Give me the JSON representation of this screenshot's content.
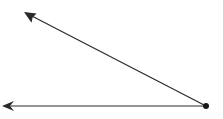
{
  "diagram": {
    "type": "angle",
    "colors": {
      "stroke": "#2a2a2a",
      "background": "#ffffff"
    },
    "vertex": {
      "x": 206,
      "y": 106
    },
    "rays": [
      {
        "name": "upper-ray",
        "to": {
          "x": 24,
          "y": 12
        }
      },
      {
        "name": "lower-ray",
        "to": {
          "x": 2,
          "y": 106
        }
      }
    ]
  }
}
